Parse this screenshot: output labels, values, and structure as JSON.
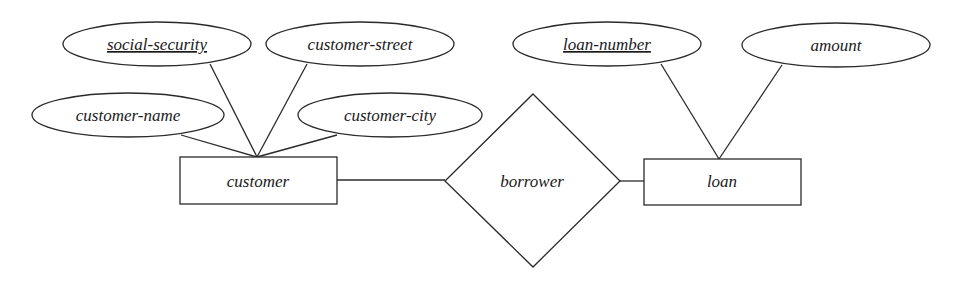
{
  "diagram": {
    "type": "ER diagram",
    "entities": [
      {
        "id": "customer",
        "label": "customer"
      },
      {
        "id": "loan",
        "label": "loan"
      }
    ],
    "relationships": [
      {
        "id": "borrower",
        "label": "borrower",
        "connects": [
          "customer",
          "loan"
        ]
      }
    ],
    "attributes": [
      {
        "id": "social-security",
        "label": "social-security",
        "entity": "customer",
        "key": true
      },
      {
        "id": "customer-street",
        "label": "customer-street",
        "entity": "customer",
        "key": false
      },
      {
        "id": "customer-name",
        "label": "customer-name",
        "entity": "customer",
        "key": false
      },
      {
        "id": "customer-city",
        "label": "customer-city",
        "entity": "customer",
        "key": false
      },
      {
        "id": "loan-number",
        "label": "loan-number",
        "entity": "loan",
        "key": true
      },
      {
        "id": "amount",
        "label": "amount",
        "entity": "loan",
        "key": false
      }
    ]
  },
  "labels": {
    "social_security": "social-security",
    "customer_street": "customer-street",
    "customer_name": "customer-name",
    "customer_city": "customer-city",
    "customer": "customer",
    "borrower": "borrower",
    "loan": "loan",
    "loan_number": "loan-number",
    "amount": "amount"
  },
  "colors": {
    "stroke": "#2a2a2a",
    "background": "#ffffff",
    "text": "#1a1a1a"
  }
}
